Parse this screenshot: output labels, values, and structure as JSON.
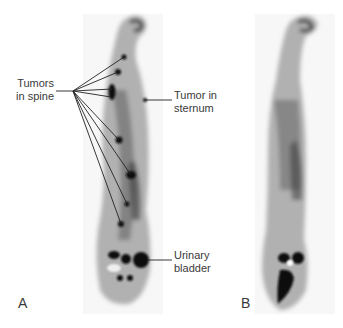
{
  "figure": {
    "panels": [
      {
        "id": "A",
        "letter": "A"
      },
      {
        "id": "B",
        "letter": "B"
      }
    ],
    "annotations": {
      "tumors_spine_line1": "Tumors",
      "tumors_spine_line2": "in spine",
      "tumor_sternum_line1": "Tumor in",
      "tumor_sternum_line2": "sternum",
      "urinary_line1": "Urinary",
      "urinary_line2": "bladder"
    },
    "colors": {
      "background": "#ffffff",
      "scan_bg": "#f7f7f7",
      "uptake": "#111111",
      "text": "#3a3a3a"
    }
  }
}
